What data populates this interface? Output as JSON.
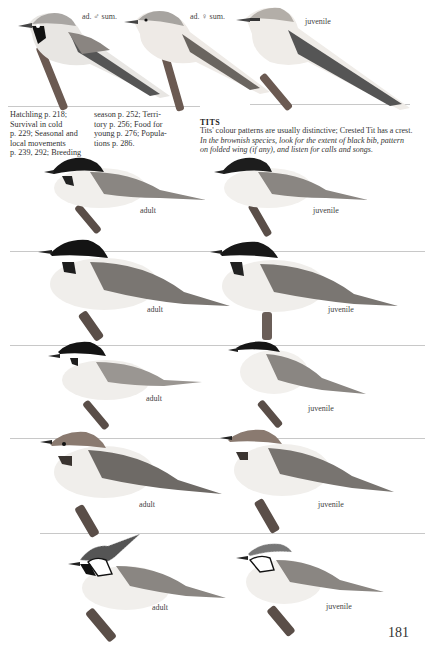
{
  "top_row": {
    "labels": [
      "ad. ♂ sum.",
      "ad. ♀ sum.",
      "juvenile"
    ]
  },
  "sidebar_text": {
    "col1": [
      "Hatchling p. 218;",
      "Survival in cold",
      "p. 229; Seasonal and",
      "local movements",
      "p. 239, 292; Breeding"
    ],
    "col2": [
      "season p. 252; Terri-",
      "tory p. 256; Food for",
      "young p. 276; Popula-",
      "tions p. 286."
    ]
  },
  "section": {
    "heading": "TITS",
    "line1": "Tits' colour patterns are usually distinctive; Crested Tit has a crest.",
    "line2": "In the brownish species, look for the extent of black bib, pattern",
    "line3": "on folded wing (if any), and listen for calls and songs."
  },
  "rows": [
    {
      "left": "adult",
      "right": "juvenile"
    },
    {
      "left": "adult",
      "right": "juvenile"
    },
    {
      "left": "adult",
      "right": "juvenile"
    },
    {
      "left": "adult",
      "right": "juvenile"
    },
    {
      "left": "adult",
      "right": "juvenile"
    }
  ],
  "page_number": "181"
}
